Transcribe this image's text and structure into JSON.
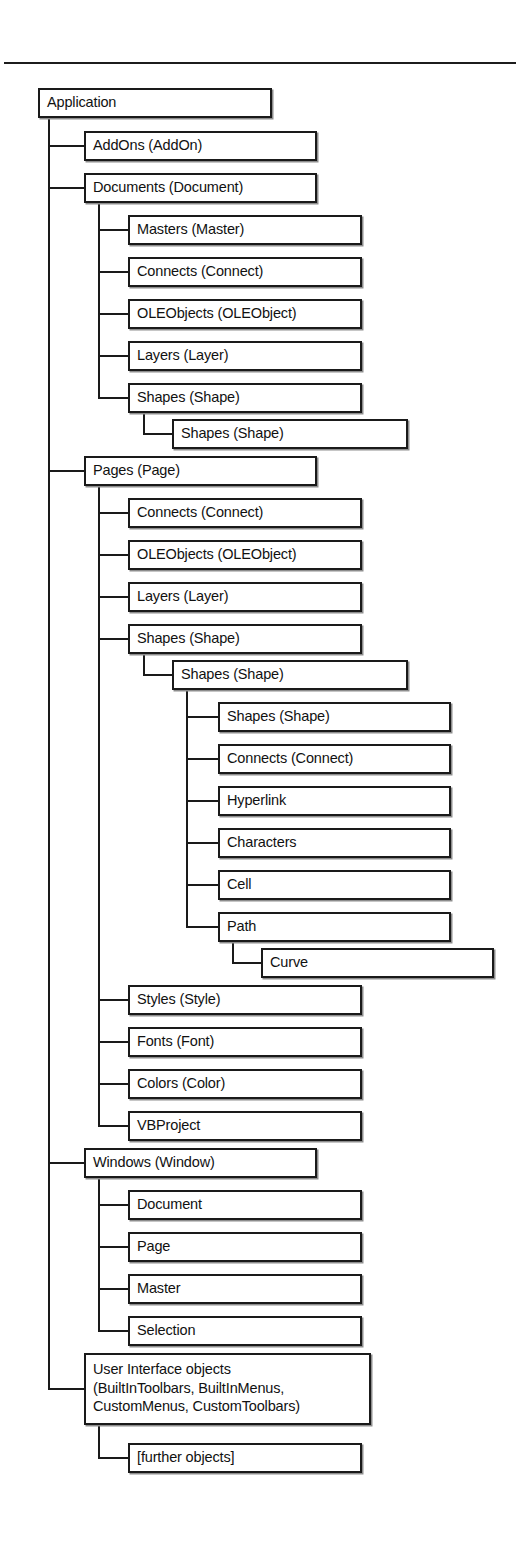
{
  "diagram": {
    "title_rule": "horizontal-rule",
    "root": "Application",
    "type": "object-model-hierarchy-tree",
    "nodes": [
      {
        "id": "n0",
        "label": "Application",
        "level": 0,
        "x": 38,
        "y": 88,
        "w": 234,
        "h": 30
      },
      {
        "id": "n1",
        "label": "AddOns (AddOn)",
        "level": 1,
        "x": 84,
        "y": 131,
        "w": 233,
        "h": 30
      },
      {
        "id": "n2",
        "label": "Documents (Document)",
        "level": 1,
        "x": 84,
        "y": 173,
        "w": 233,
        "h": 30
      },
      {
        "id": "n3",
        "label": "Masters (Master)",
        "level": 2,
        "x": 128,
        "y": 215,
        "w": 234,
        "h": 30
      },
      {
        "id": "n4",
        "label": "Connects (Connect)",
        "level": 2,
        "x": 128,
        "y": 257,
        "w": 234,
        "h": 30
      },
      {
        "id": "n5",
        "label": "OLEObjects (OLEObject)",
        "level": 2,
        "x": 128,
        "y": 299,
        "w": 234,
        "h": 30
      },
      {
        "id": "n6",
        "label": "Layers (Layer)",
        "level": 2,
        "x": 128,
        "y": 341,
        "w": 234,
        "h": 30
      },
      {
        "id": "n7",
        "label": "Shapes (Shape)",
        "level": 2,
        "x": 128,
        "y": 383,
        "w": 234,
        "h": 30
      },
      {
        "id": "n8",
        "label": "Shapes (Shape)",
        "level": 3,
        "x": 172,
        "y": 419,
        "w": 236,
        "h": 30
      },
      {
        "id": "n9",
        "label": "Pages (Page)",
        "level": 1,
        "x": 84,
        "y": 456,
        "w": 233,
        "h": 30
      },
      {
        "id": "n10",
        "label": "Connects (Connect)",
        "level": 2,
        "x": 128,
        "y": 498,
        "w": 234,
        "h": 30
      },
      {
        "id": "n11",
        "label": "OLEObjects (OLEObject)",
        "level": 2,
        "x": 128,
        "y": 540,
        "w": 234,
        "h": 30
      },
      {
        "id": "n12",
        "label": "Layers (Layer)",
        "level": 2,
        "x": 128,
        "y": 582,
        "w": 234,
        "h": 30
      },
      {
        "id": "n13",
        "label": "Shapes (Shape)",
        "level": 2,
        "x": 128,
        "y": 624,
        "w": 234,
        "h": 30
      },
      {
        "id": "n14",
        "label": "Shapes (Shape)",
        "level": 3,
        "x": 172,
        "y": 660,
        "w": 236,
        "h": 30
      },
      {
        "id": "n15",
        "label": "Shapes (Shape)",
        "level": 4,
        "x": 218,
        "y": 702,
        "w": 233,
        "h": 30
      },
      {
        "id": "n16",
        "label": "Connects (Connect)",
        "level": 4,
        "x": 218,
        "y": 744,
        "w": 233,
        "h": 30
      },
      {
        "id": "n17",
        "label": "Hyperlink",
        "level": 4,
        "x": 218,
        "y": 786,
        "w": 233,
        "h": 30
      },
      {
        "id": "n18",
        "label": "Characters",
        "level": 4,
        "x": 218,
        "y": 828,
        "w": 233,
        "h": 30
      },
      {
        "id": "n19",
        "label": "Cell",
        "level": 4,
        "x": 218,
        "y": 870,
        "w": 233,
        "h": 30
      },
      {
        "id": "n20",
        "label": "Path",
        "level": 4,
        "x": 218,
        "y": 912,
        "w": 233,
        "h": 30
      },
      {
        "id": "n21",
        "label": "Curve",
        "level": 5,
        "x": 261,
        "y": 948,
        "w": 233,
        "h": 30
      },
      {
        "id": "n22",
        "label": "Styles (Style)",
        "level": 2,
        "x": 128,
        "y": 985,
        "w": 234,
        "h": 30
      },
      {
        "id": "n23",
        "label": "Fonts (Font)",
        "level": 2,
        "x": 128,
        "y": 1027,
        "w": 234,
        "h": 30
      },
      {
        "id": "n24",
        "label": "Colors (Color)",
        "level": 2,
        "x": 128,
        "y": 1069,
        "w": 234,
        "h": 30
      },
      {
        "id": "n25",
        "label": "VBProject",
        "level": 2,
        "x": 128,
        "y": 1111,
        "w": 234,
        "h": 30
      },
      {
        "id": "n26",
        "label": "Windows (Window)",
        "level": 1,
        "x": 84,
        "y": 1148,
        "w": 233,
        "h": 30
      },
      {
        "id": "n27",
        "label": "Document",
        "level": 2,
        "x": 128,
        "y": 1190,
        "w": 234,
        "h": 30
      },
      {
        "id": "n28",
        "label": "Page",
        "level": 2,
        "x": 128,
        "y": 1232,
        "w": 234,
        "h": 30
      },
      {
        "id": "n29",
        "label": "Master",
        "level": 2,
        "x": 128,
        "y": 1274,
        "w": 234,
        "h": 30
      },
      {
        "id": "n30",
        "label": "Selection",
        "level": 2,
        "x": 128,
        "y": 1316,
        "w": 234,
        "h": 30
      },
      {
        "id": "n31",
        "label": "User Interface objects\n(BuiltInToolbars, BuiltInMenus,\n   CustomMenus, CustomToolbars)",
        "level": 1,
        "x": 84,
        "y": 1353,
        "w": 287,
        "h": 72,
        "multiline": true
      },
      {
        "id": "n32",
        "label": "[further objects]",
        "level": 2,
        "x": 128,
        "y": 1443,
        "w": 234,
        "h": 30
      }
    ],
    "connectors": [
      {
        "parent": "n0",
        "bus_x": 48,
        "stub_x": 84,
        "from_y": 118,
        "to_y": 1389,
        "children_y": [
          146,
          188,
          471,
          1163,
          1389
        ]
      },
      {
        "parent": "n2",
        "bus_x": 98,
        "stub_x": 128,
        "from_y": 203,
        "to_y": 398,
        "children_y": [
          230,
          272,
          314,
          356,
          398
        ]
      },
      {
        "parent": "n7",
        "bus_x": 143,
        "stub_x": 172,
        "from_y": 413,
        "to_y": 434,
        "children_y": [
          434
        ]
      },
      {
        "parent": "n9",
        "bus_x": 98,
        "stub_x": 128,
        "from_y": 486,
        "to_y": 1126,
        "children_y": [
          513,
          555,
          597,
          639,
          1000,
          1042,
          1084,
          1126
        ]
      },
      {
        "parent": "n13",
        "bus_x": 143,
        "stub_x": 172,
        "from_y": 654,
        "to_y": 675,
        "children_y": [
          675
        ]
      },
      {
        "parent": "n14",
        "bus_x": 186,
        "stub_x": 218,
        "from_y": 690,
        "to_y": 927,
        "children_y": [
          717,
          759,
          801,
          843,
          885,
          927
        ]
      },
      {
        "parent": "n20",
        "bus_x": 232,
        "stub_x": 261,
        "from_y": 942,
        "to_y": 963,
        "children_y": [
          963
        ]
      },
      {
        "parent": "n26",
        "bus_x": 98,
        "stub_x": 128,
        "from_y": 1178,
        "to_y": 1331,
        "children_y": [
          1205,
          1247,
          1289,
          1331
        ]
      },
      {
        "parent": "n31",
        "bus_x": 98,
        "stub_x": 128,
        "from_y": 1425,
        "to_y": 1458,
        "children_y": [
          1458
        ]
      }
    ]
  }
}
